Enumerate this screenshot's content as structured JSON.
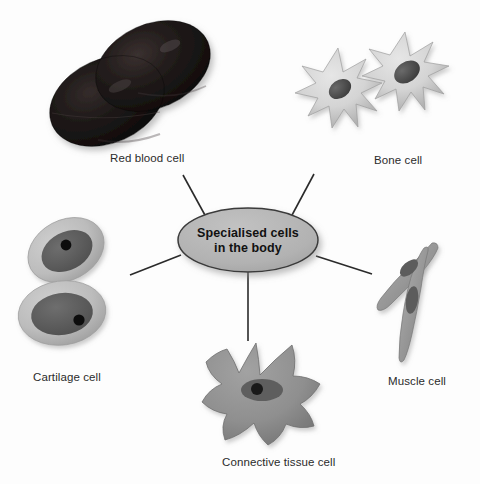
{
  "diagram": {
    "type": "spider-web-concept-map",
    "background_color": "#fdfdfd",
    "center": {
      "line1": "Specialised cells",
      "line2": "in the body",
      "shape": "ellipse",
      "fill_color": "#b3b3b3",
      "stroke_color": "#3a3a3a"
    },
    "connector_color": "#2a2a2a",
    "nodes": [
      {
        "id": "red-blood-cell",
        "label": "Red blood cell",
        "label_x": 110,
        "label_y": 152,
        "cell_color": "#1a1614",
        "shape": "biconcave-discs"
      },
      {
        "id": "bone-cell",
        "label": "Bone cell",
        "label_x": 374,
        "label_y": 154,
        "cell_color": "#d2d2d2",
        "nucleus_color": "#4a4a4a",
        "shape": "stellate-osteocytes"
      },
      {
        "id": "cartilage-cell",
        "label": "Cartilage cell",
        "label_x": 33,
        "label_y": 371,
        "cell_color": "#bdbdbd",
        "nucleus_color": "#5f5f5f",
        "nucleolus_color": "#111111",
        "shape": "paired-chondrocytes"
      },
      {
        "id": "connective-tissue-cell",
        "label": "Connective tissue cell",
        "label_x": 222,
        "label_y": 456,
        "cell_color": "#8f8f8f",
        "nucleus_color": "#5a5a5a",
        "nucleolus_color": "#1a1a1a",
        "shape": "amoeboid-fibroblast"
      },
      {
        "id": "muscle-cell",
        "label": "Muscle cell",
        "label_x": 388,
        "label_y": 375,
        "cell_color": "#9a9a9a",
        "nucleus_color": "#5a5a5a",
        "shape": "spindle-myocytes"
      }
    ]
  }
}
